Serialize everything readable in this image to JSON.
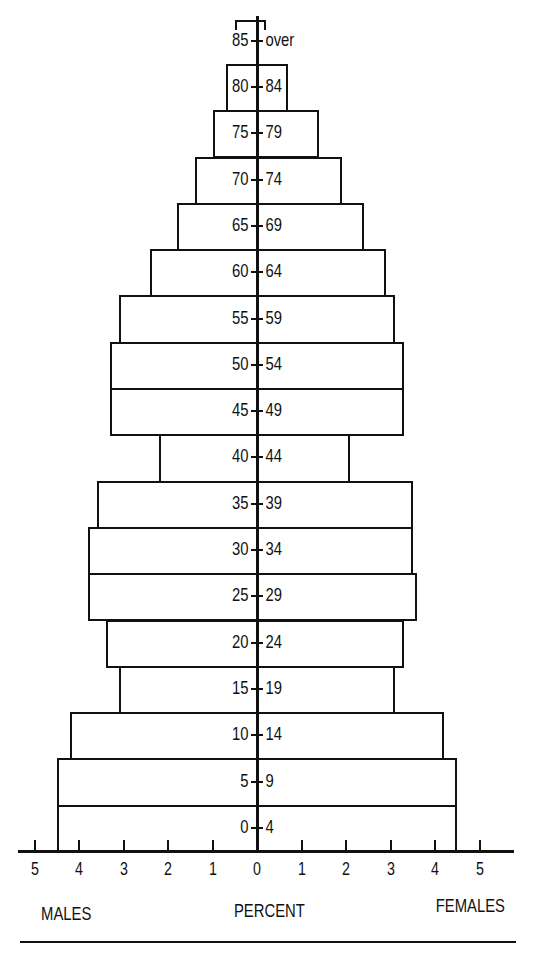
{
  "chart_data": {
    "type": "bar",
    "subtype": "population-pyramid",
    "title": "",
    "xlabel": "PERCENT",
    "left_label": "MALES",
    "right_label": "FEMALES",
    "x_ticks_left": [
      "5",
      "4",
      "3",
      "2",
      "1"
    ],
    "x_tick_center": "0",
    "x_ticks_right": [
      "1",
      "2",
      "3",
      "4",
      "5"
    ],
    "xlim": [
      -5,
      5
    ],
    "grid": false,
    "categories": [
      "0-4",
      "5-9",
      "10-14",
      "15-19",
      "20-24",
      "25-29",
      "30-34",
      "35-39",
      "40-44",
      "45-49",
      "50-54",
      "55-59",
      "60-64",
      "65-69",
      "70-74",
      "75-79",
      "80-84",
      "85-over"
    ],
    "age_left": [
      "0",
      "5",
      "10",
      "15",
      "20",
      "25",
      "30",
      "35",
      "40",
      "45",
      "50",
      "55",
      "60",
      "65",
      "70",
      "75",
      "80",
      "85"
    ],
    "age_right": [
      "4",
      "9",
      "14",
      "19",
      "24",
      "29",
      "34",
      "39",
      "44",
      "49",
      "54",
      "59",
      "64",
      "69",
      "74",
      "79",
      "84",
      "over"
    ],
    "series": [
      {
        "name": "MALES",
        "values": [
          4.5,
          4.5,
          4.2,
          3.1,
          3.4,
          3.8,
          3.8,
          3.6,
          2.2,
          3.3,
          3.3,
          3.1,
          2.4,
          1.8,
          1.4,
          1.0,
          0.7,
          0.5
        ]
      },
      {
        "name": "FEMALES",
        "values": [
          4.5,
          4.5,
          4.2,
          3.1,
          3.3,
          3.6,
          3.5,
          3.5,
          2.1,
          3.3,
          3.3,
          3.1,
          2.9,
          2.4,
          1.9,
          1.4,
          0.7,
          0.2
        ]
      }
    ]
  },
  "labels": {
    "males": "MALES",
    "percent": "PERCENT",
    "females": "FEMALES"
  }
}
